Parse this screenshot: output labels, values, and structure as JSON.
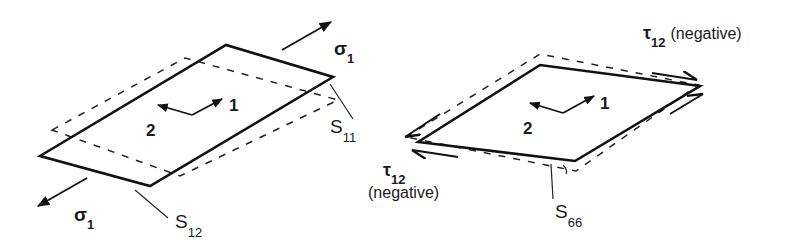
{
  "figure": {
    "left_panel": {
      "description": "Uniaxial stress sigma_1 along fiber direction 1; deformed shape shows extension (S11) and lateral contraction (S12)",
      "stress_label_top": {
        "symbol": "σ",
        "subscript": "1"
      },
      "stress_label_bottom": {
        "symbol": "σ",
        "subscript": "1"
      },
      "axis_1_label": "1",
      "axis_2_label": "2",
      "compliance_label_a": {
        "symbol": "S",
        "subscript": "11"
      },
      "compliance_label_b": {
        "symbol": "S",
        "subscript": "12"
      }
    },
    "right_panel": {
      "description": "Negative in-plane shear stress tau_12; deformed shape shows shear distortion (S66)",
      "shear_label_top": {
        "symbol": "τ",
        "subscript": "12",
        "note": "(negative)"
      },
      "shear_label_left": {
        "symbol": "τ",
        "subscript": "12",
        "note": "(negative)"
      },
      "axis_1_label": "1",
      "axis_2_label": "2",
      "compliance_label": {
        "symbol": "S",
        "subscript": "66"
      }
    },
    "colors": {
      "line": "#111111",
      "background": "#ffffff"
    }
  }
}
